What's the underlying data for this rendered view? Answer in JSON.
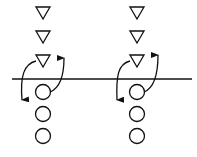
{
  "diagram": {
    "line": {
      "x1": 12,
      "x2": 192,
      "y": 79
    },
    "stroke_color": "#111111",
    "columns": [
      {
        "id": "left",
        "cx": 43,
        "triangles_y": [
          13,
          37,
          61
        ],
        "circles_y": [
          92,
          114,
          136
        ]
      },
      {
        "id": "right",
        "cx": 137,
        "triangles_y": [
          13,
          37,
          61
        ],
        "circles_y": [
          92,
          114,
          136
        ]
      }
    ]
  }
}
